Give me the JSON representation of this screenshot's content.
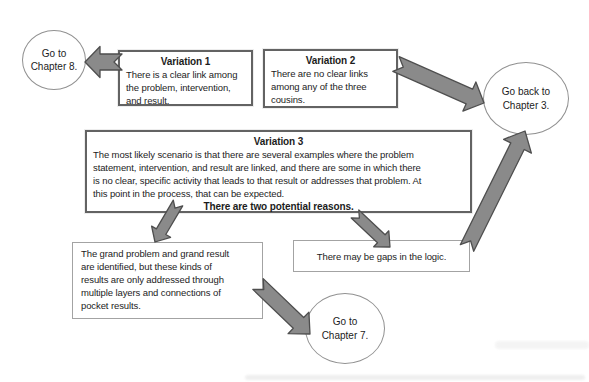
{
  "diagram": {
    "nodes": {
      "chapter8": {
        "lines": [
          "Go to",
          "Chapter 8."
        ]
      },
      "variation1": {
        "title": "Variation 1",
        "lines": [
          "There is a clear link among",
          "the problem, intervention,",
          "and result."
        ]
      },
      "variation2": {
        "title": "Variation 2",
        "lines": [
          "There are no clear links",
          "among any of the three",
          "cousins."
        ]
      },
      "chapter3": {
        "lines": [
          "Go back to",
          "Chapter 3."
        ]
      },
      "variation3": {
        "title": "Variation 3",
        "lines": [
          "The most likely scenario is that there are several examples where the problem",
          "statement, intervention, and result are linked, and there are some in which there",
          "is no clear, specific activity that leads to that result or addresses that problem. At",
          "this point in the process, that can be expected."
        ],
        "emphasis": "There are two potential reasons."
      },
      "grand_problem": {
        "lines": [
          "The grand problem and grand result",
          "are identified, but these kinds of",
          "results are only addressed through",
          "multiple layers and connections of",
          "pocket results."
        ]
      },
      "gaps": {
        "lines": [
          "There may be gaps in the logic."
        ]
      },
      "chapter7": {
        "lines": [
          "Go to",
          "Chapter 7."
        ]
      }
    },
    "edges": [
      {
        "from": "variation1",
        "to": "chapter8"
      },
      {
        "from": "variation2",
        "to": "chapter3"
      },
      {
        "from": "variation3",
        "to": "grand_problem"
      },
      {
        "from": "variation3",
        "to": "gaps"
      },
      {
        "from": "gaps",
        "to": "chapter3"
      },
      {
        "from": "grand_problem",
        "to": "chapter7"
      }
    ]
  },
  "colors": {
    "background": "#ffffff",
    "text": "#1c1c1c",
    "arrow_fill": "#8a8a8a",
    "arrow_stroke": "#4e4e4e",
    "box_border": "#636363",
    "thin_border": "#a3a3a3",
    "ellipse_border": "#919191"
  }
}
